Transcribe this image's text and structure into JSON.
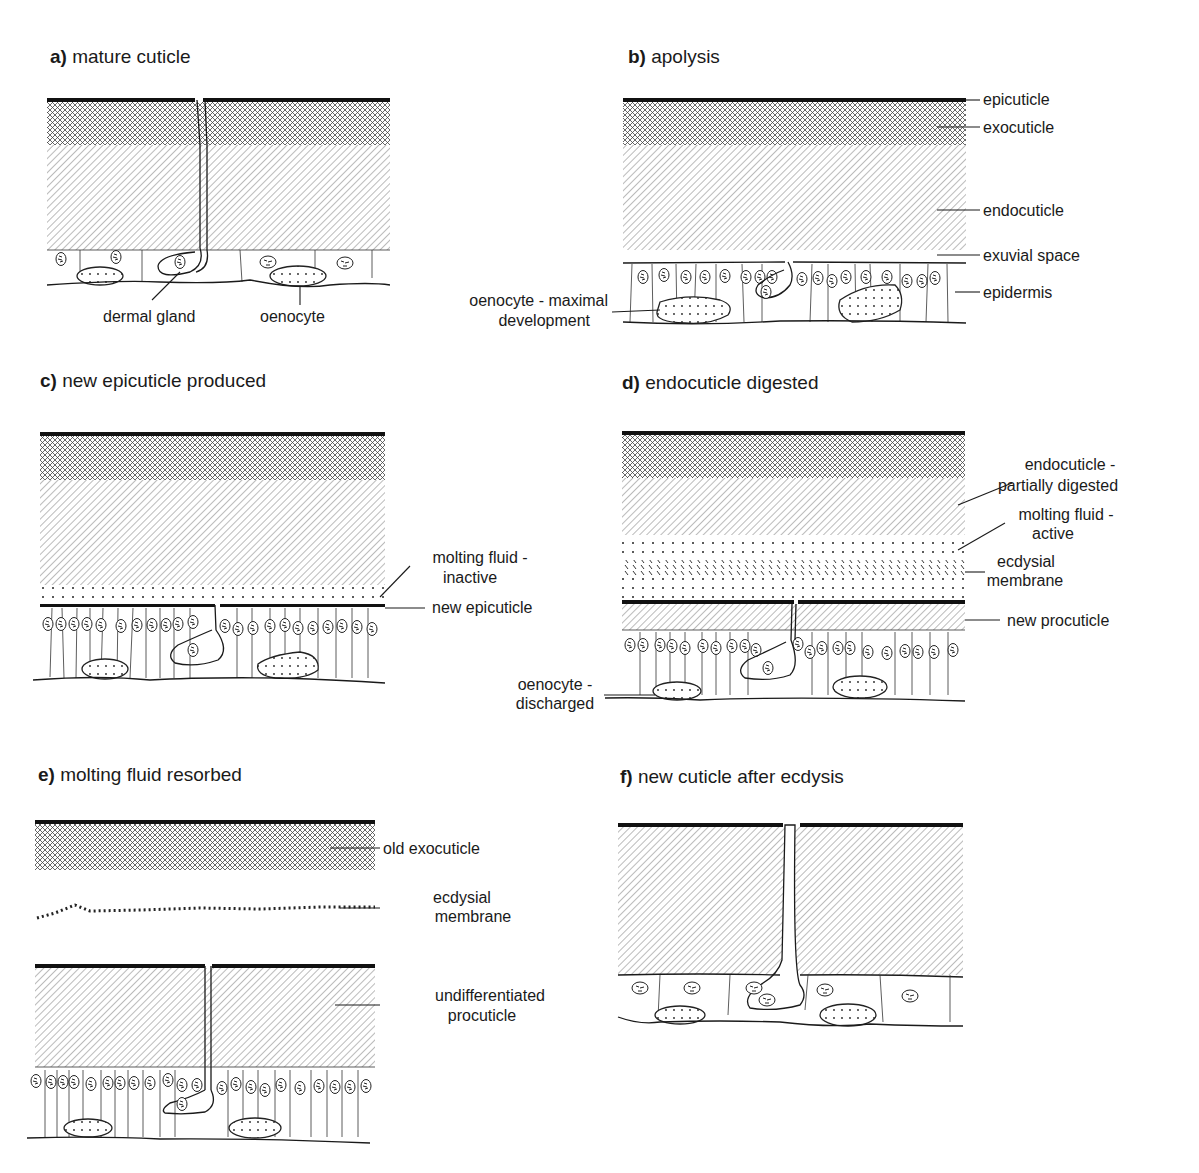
{
  "figure": {
    "panels": [
      {
        "id": "a",
        "letter": "a)",
        "title": "mature cuticle",
        "labels": [
          "dermal gland",
          "oenocyte"
        ]
      },
      {
        "id": "b",
        "letter": "b)",
        "title": "apolysis",
        "labels": [
          "epicuticle",
          "exocuticle",
          "endocuticle",
          "exuvial space",
          "epidermis",
          "oenocyte - maximal",
          "development"
        ]
      },
      {
        "id": "c",
        "letter": "c)",
        "title": "new epicuticle produced",
        "labels": [
          "molting fluid -",
          "inactive",
          "new epicuticle"
        ]
      },
      {
        "id": "d",
        "letter": "d)",
        "title": "endocuticle digested",
        "labels": [
          "endocuticle -",
          "partially digested",
          "molting fluid -",
          "active",
          "ecdysial",
          "membrane",
          "new procuticle",
          "oenocyte -",
          "discharged"
        ]
      },
      {
        "id": "e",
        "letter": "e)",
        "title": "molting fluid resorbed",
        "labels": [
          "old exocuticle",
          "ecdysial",
          "membrane",
          "undifferentiated",
          "procuticle"
        ]
      },
      {
        "id": "f",
        "letter": "f)",
        "title": "new cuticle after ecdysis",
        "labels": []
      }
    ]
  }
}
